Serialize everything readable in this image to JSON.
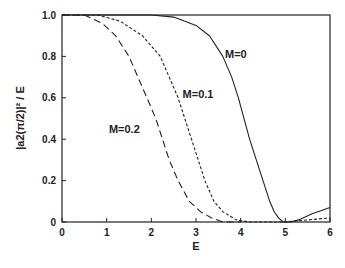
{
  "chart_data": {
    "type": "line",
    "title": "",
    "xlabel": "E",
    "ylabel": "|a2(π/2)|² / E",
    "xlim": [
      0,
      6
    ],
    "ylim": [
      0,
      1.0
    ],
    "xticks": [
      "0",
      "1",
      "2",
      "3",
      "4",
      "5",
      "6"
    ],
    "yticks": [
      "0",
      "0.2",
      "0.4",
      "0.6",
      "0.8",
      "1.0"
    ],
    "grid": false,
    "legend": "inline labels",
    "series": [
      {
        "name": "M=0",
        "style": "solid",
        "x": [
          0,
          1,
          2,
          2.5,
          3.0,
          3.3,
          3.6,
          3.8,
          3.95,
          4.1,
          4.2,
          4.35,
          4.5,
          4.65,
          4.75,
          4.85,
          4.95,
          5.1,
          5.3,
          5.6,
          6.0
        ],
        "y": [
          1.0,
          1.0,
          1.0,
          0.99,
          0.95,
          0.9,
          0.8,
          0.7,
          0.6,
          0.48,
          0.4,
          0.3,
          0.2,
          0.1,
          0.05,
          0.02,
          0.0,
          0.0,
          0.01,
          0.04,
          0.07
        ]
      },
      {
        "name": "M=0.1",
        "style": "short-dash",
        "x": [
          0,
          0.8,
          1.3,
          1.8,
          2.2,
          2.4,
          2.6,
          2.75,
          2.9,
          3.05,
          3.2,
          3.4,
          3.6,
          3.9,
          4.2,
          5.0,
          6.0
        ],
        "y": [
          1.0,
          1.0,
          0.97,
          0.9,
          0.8,
          0.7,
          0.6,
          0.5,
          0.4,
          0.3,
          0.2,
          0.1,
          0.05,
          0.01,
          0.0,
          0.0,
          0.02
        ]
      },
      {
        "name": "M=0.2",
        "style": "long-dash",
        "x": [
          0,
          0.5,
          0.9,
          1.2,
          1.5,
          1.7,
          1.9,
          2.1,
          2.25,
          2.4,
          2.6,
          2.85,
          3.1,
          3.35,
          3.6,
          4.0
        ],
        "y": [
          1.0,
          1.0,
          0.96,
          0.9,
          0.8,
          0.7,
          0.6,
          0.5,
          0.4,
          0.3,
          0.2,
          0.1,
          0.05,
          0.02,
          0.0,
          0.0
        ]
      }
    ],
    "annotations": [
      {
        "text": "M=0",
        "x": 3.65,
        "y": 0.79
      },
      {
        "text": "M=0.1",
        "x": 2.7,
        "y": 0.6
      },
      {
        "text": "M=0.2",
        "x": 1.05,
        "y": 0.43
      }
    ]
  }
}
